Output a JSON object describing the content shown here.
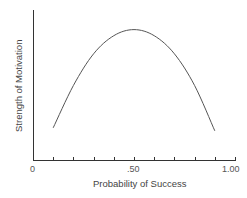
{
  "chart_data": {
    "type": "line",
    "title": "",
    "xlabel": "Probability of Success",
    "ylabel": "Strength of Motivation",
    "xlim": [
      0,
      1.0
    ],
    "ylim": [
      0,
      1.0
    ],
    "x_tick_labels": [
      {
        "value": 0,
        "label": "0"
      },
      {
        "value": 0.5,
        "label": ".50"
      },
      {
        "value": 1.0,
        "label": "1.00"
      }
    ],
    "x_minor_ticks": [
      0.1,
      0.2,
      0.3,
      0.4,
      0.5,
      0.6,
      0.7,
      0.8,
      0.9,
      1.0
    ],
    "y_ticks": [],
    "grid": false,
    "legend": null,
    "series": [
      {
        "name": "Motivation curve",
        "color": "#555555",
        "x": [
          0.1,
          0.2,
          0.3,
          0.4,
          0.5,
          0.6,
          0.7,
          0.8,
          0.9
        ],
        "y": [
          0.22,
          0.5,
          0.71,
          0.83,
          0.87,
          0.83,
          0.71,
          0.5,
          0.2
        ]
      }
    ]
  },
  "axis": {
    "x_title": "Probability of Success",
    "y_title": "Strength of Motivation",
    "tick_0": "0",
    "tick_50": ".50",
    "tick_100": "1.00"
  },
  "colors": {
    "axis": "#333333",
    "curve": "#555555",
    "text": "#555555"
  }
}
